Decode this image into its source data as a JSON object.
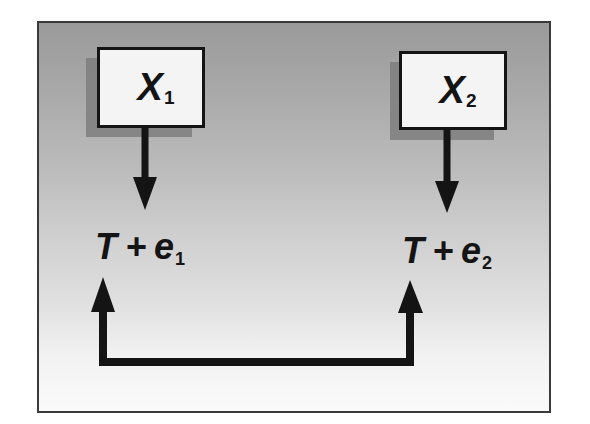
{
  "diagram": {
    "type": "measurement-model",
    "nodes": [
      {
        "id": "x1",
        "label": "X",
        "subscript": "1",
        "kind": "box"
      },
      {
        "id": "x2",
        "label": "X",
        "subscript": "2",
        "kind": "box"
      },
      {
        "id": "expr1",
        "parts": {
          "true_score": "T",
          "operator": "+",
          "error": "e",
          "subscript": "1"
        },
        "kind": "text"
      },
      {
        "id": "expr2",
        "parts": {
          "true_score": "T",
          "operator": "+",
          "error": "e",
          "subscript": "2"
        },
        "kind": "text"
      }
    ],
    "edges": [
      {
        "from": "x1",
        "to": "expr1",
        "style": "arrow-down"
      },
      {
        "from": "x2",
        "to": "expr2",
        "style": "arrow-down"
      },
      {
        "from": "bottom-connector",
        "to": "expr1",
        "style": "arrow-up"
      },
      {
        "from": "bottom-connector",
        "to": "expr2",
        "style": "arrow-up"
      },
      {
        "from": "expr1",
        "to": "expr2",
        "style": "bracket-connector-bottom"
      }
    ]
  },
  "box1": {
    "label": "X",
    "subscript": "1"
  },
  "box2": {
    "label": "X",
    "subscript": "2"
  },
  "expr1": {
    "true_score": "T",
    "operator": "+",
    "error": "e",
    "subscript": "1"
  },
  "expr2": {
    "true_score": "T",
    "operator": "+",
    "error": "e",
    "subscript": "2"
  },
  "colors": {
    "background_top": "#9a9a9a",
    "background_bottom": "#fafafa",
    "box_fill": "#f4f4f4",
    "stroke": "#141414",
    "shadow": "#7e7e7e",
    "frame_border": "#3a3a3a"
  }
}
